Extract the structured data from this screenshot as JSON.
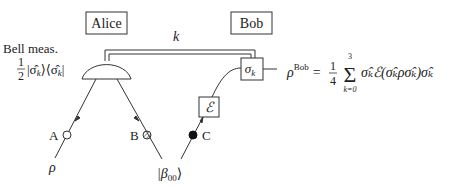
{
  "diagram": {
    "parties": [
      {
        "label": "Alice"
      },
      {
        "label": "Bob"
      }
    ],
    "classical_channel": {
      "label": "k"
    },
    "measurement": {
      "title": "Bell meas.",
      "fraction_num": "1",
      "fraction_den": "2",
      "projector": "|σ̂",
      "projector_sub": "k",
      "projector_mid": "⟩⟨σ̂",
      "projector_sub2": "k",
      "projector_end": "|"
    },
    "gates": {
      "correction": {
        "symbol": "σ",
        "sub": "k"
      },
      "channel": {
        "symbol": "ℰ"
      }
    },
    "qubits": [
      {
        "label": "A",
        "marker": "open-circle"
      },
      {
        "label": "B",
        "marker": "hatched-circle"
      },
      {
        "label": "C",
        "marker": "filled-circle"
      }
    ],
    "inputs": {
      "rho": "ρ",
      "bell_state": "|β",
      "bell_state_sub": "00",
      "bell_state_end": "⟩"
    },
    "output_formula": {
      "lhs": "ρ",
      "lhs_sup": "Bob",
      "eq": "=",
      "frac_num": "1",
      "frac_den": "4",
      "sum_upper": "3",
      "sum_lower": "k=0",
      "body": "σ̂ₖℰ(σ̂ₖρσ̂ₖ)σ̂ₖ"
    }
  }
}
